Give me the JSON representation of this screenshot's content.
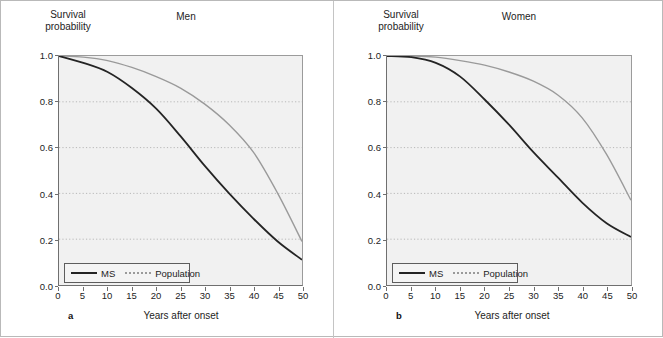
{
  "figure": {
    "ylabel": "Survival\nprobability",
    "xlabel": "Years after onset",
    "series_colors": {
      "ms": "#242424",
      "population": "#9a9a9a"
    },
    "legend": {
      "ms_label": "MS",
      "population_label": "Population"
    }
  },
  "panels": [
    {
      "letter": "a",
      "title": "Men"
    },
    {
      "letter": "b",
      "title": "Women"
    }
  ],
  "chart_data": [
    {
      "type": "line",
      "title": "Men",
      "panel_letter": "a",
      "xlabel": "Years after onset",
      "ylabel": "Survival probability",
      "xlim": [
        0,
        50
      ],
      "ylim": [
        0.0,
        1.0
      ],
      "xticks": [
        0,
        5,
        10,
        15,
        20,
        25,
        30,
        35,
        40,
        45,
        50
      ],
      "yticks": [
        "0.0",
        "0.2",
        "0.4",
        "0.6",
        "0.8",
        "1.0"
      ],
      "grid": "horizontal-dotted",
      "legend": [
        "MS",
        "Population"
      ],
      "legend_position": "bottom-left",
      "x": [
        0,
        5,
        10,
        15,
        20,
        25,
        30,
        35,
        40,
        45,
        50
      ],
      "series": [
        {
          "name": "MS",
          "values": [
            1.0,
            0.97,
            0.93,
            0.86,
            0.77,
            0.65,
            0.52,
            0.4,
            0.29,
            0.19,
            0.11
          ]
        },
        {
          "name": "Population",
          "values": [
            1.0,
            0.995,
            0.98,
            0.95,
            0.91,
            0.86,
            0.79,
            0.7,
            0.58,
            0.4,
            0.19
          ]
        }
      ]
    },
    {
      "type": "line",
      "title": "Women",
      "panel_letter": "b",
      "xlabel": "Years after onset",
      "ylabel": "Survival probability",
      "xlim": [
        0,
        50
      ],
      "ylim": [
        0.0,
        1.0
      ],
      "xticks": [
        0,
        5,
        10,
        15,
        20,
        25,
        30,
        35,
        40,
        45,
        50
      ],
      "yticks": [
        "0.0",
        "0.2",
        "0.4",
        "0.6",
        "0.8",
        "1.0"
      ],
      "grid": "horizontal-dotted",
      "legend": [
        "MS",
        "Population"
      ],
      "legend_position": "bottom-left",
      "x": [
        0,
        5,
        10,
        15,
        20,
        25,
        30,
        35,
        40,
        45,
        50
      ],
      "series": [
        {
          "name": "MS",
          "values": [
            1.0,
            0.995,
            0.97,
            0.91,
            0.81,
            0.7,
            0.58,
            0.47,
            0.36,
            0.27,
            0.21
          ]
        },
        {
          "name": "Population",
          "values": [
            1.0,
            1.0,
            0.995,
            0.98,
            0.96,
            0.93,
            0.89,
            0.83,
            0.73,
            0.57,
            0.37
          ]
        }
      ]
    }
  ]
}
